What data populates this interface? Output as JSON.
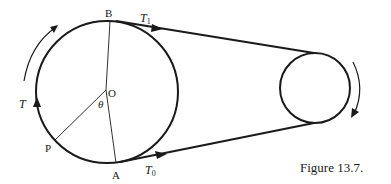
{
  "figure": {
    "caption": "Figure 13.7.",
    "labels": {
      "B": "B",
      "A": "A",
      "O": "O",
      "P": "P",
      "theta": "θ",
      "T": "T",
      "T1_main": "T",
      "T1_sub": "1",
      "T0_main": "T",
      "T0_sub": "0"
    },
    "colors": {
      "stroke": "#1a1a1a",
      "background": "#ffffff"
    }
  }
}
